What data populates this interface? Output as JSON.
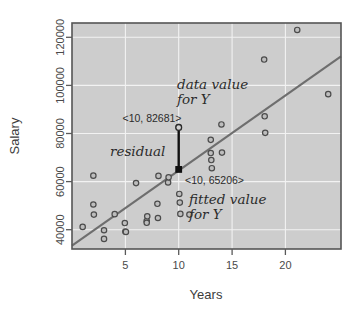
{
  "chart_data": {
    "type": "scatter",
    "title": "",
    "xlabel": "Years",
    "ylabel": "Salary",
    "xlim": [
      0,
      25.2
    ],
    "ylim": [
      32000,
      126000
    ],
    "grid": true,
    "legend": "none",
    "xticks": [
      5,
      10,
      15,
      20
    ],
    "xtick_labels": [
      "5",
      "10",
      "15",
      "20"
    ],
    "yticks": [
      40000,
      60000,
      80000,
      100000,
      120000
    ],
    "ytick_labels": [
      "40000",
      "60000",
      "80000",
      "100000",
      "120000"
    ],
    "series": [
      {
        "name": "observations",
        "x": [
          1.0,
          2.0,
          2.0,
          2.05,
          3.0,
          3.0,
          4.0,
          4.95,
          5.0,
          5.05,
          6.0,
          7.0,
          7.0,
          7.05,
          8.0,
          8.05,
          8.1,
          9.0,
          9.05,
          10.0,
          10.05,
          10.1,
          10.15,
          11.0,
          13.0,
          13.0,
          13.05,
          13.1,
          14.0,
          14.05,
          18.0,
          18.05,
          18.1,
          21.1,
          24.0
        ],
        "y": [
          41200,
          62500,
          50500,
          46300,
          39800,
          36200,
          46500,
          42800,
          39300,
          39100,
          59400,
          43600,
          42900,
          45600,
          50800,
          44900,
          62400,
          59700,
          61800,
          82681,
          54900,
          51300,
          46600,
          46300,
          77400,
          71900,
          69000,
          65600,
          83800,
          72100,
          110800,
          87200,
          80300,
          123100,
          96400
        ]
      }
    ],
    "regression_line": {
      "name": "fitted line",
      "x_start": 0.0,
      "y_start": 33800,
      "x_end": 25.2,
      "y_end": 112500
    },
    "annotations": [
      {
        "name": "data-value-note",
        "text_line1": "data value",
        "text_line2": "for Y",
        "style": "script-italic"
      },
      {
        "name": "data-value-coord",
        "text": "<10, 82681>",
        "style": "sans"
      },
      {
        "name": "residual-note",
        "text": "residual",
        "style": "script-italic"
      },
      {
        "name": "fitted-value-coord",
        "text": "<10, 65206>",
        "style": "sans"
      },
      {
        "name": "fitted-value-note",
        "text_line1": "fitted value",
        "text_line2": "for Y",
        "style": "script-italic"
      }
    ],
    "highlighted_points": [
      {
        "name": "observed-y",
        "x": 10,
        "y": 82681,
        "label": "<10, 82681>"
      },
      {
        "name": "fitted-y",
        "x": 10,
        "y": 65206,
        "label": "<10, 65206>"
      }
    ],
    "residual_segment": {
      "x": 10,
      "y_top": 82681,
      "y_bottom": 65206
    },
    "colors": {
      "plot_background": "#cdcdcd",
      "gridline": "#f2f2f2",
      "frame": "#555555",
      "regression_line": "#6e6e6e",
      "point_fill": "#bdbdbd",
      "point_stroke": "#4b4b4b",
      "residual": "#111111",
      "text": "#3b3b3b",
      "page_background": "#ffffff"
    }
  },
  "labels": {
    "x_axis_title": "Years",
    "y_axis_title": "Salary",
    "ytick_0": "40000",
    "ytick_1": "60000",
    "ytick_2": "80000",
    "ytick_3": "100000",
    "ytick_4": "120000",
    "xtick_0": "5",
    "xtick_1": "10",
    "xtick_2": "15",
    "xtick_3": "20",
    "ann_data_value_l1": "data value",
    "ann_data_value_l2": "for Y",
    "ann_data_coord": "<10, 82681>",
    "ann_residual": "residual",
    "ann_fitted_coord": "<10, 65206>",
    "ann_fitted_value_l1": "fitted value",
    "ann_fitted_value_l2": "for Y"
  }
}
